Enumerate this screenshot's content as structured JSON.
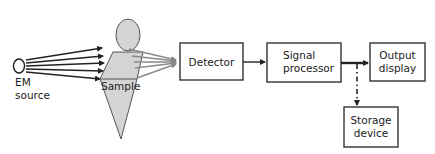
{
  "diagram": {
    "title": "",
    "nodes": {
      "em_source": {
        "line1": "EM",
        "line2": "source"
      },
      "sample": {
        "label": "Sample"
      },
      "detector": {
        "label": "Detector"
      },
      "signal_processor": {
        "line1": "Signal",
        "line2": "processor"
      },
      "output_display": {
        "line1": "Output",
        "line2": "display"
      },
      "storage_device": {
        "line1": "Storage",
        "line2": "device"
      }
    },
    "edges": [
      {
        "from": "EM source",
        "to": "Sample",
        "style": "multiple dark arrows"
      },
      {
        "from": "Sample",
        "to": "Detector",
        "style": "multiple gray converging rays"
      },
      {
        "from": "Detector",
        "to": "Signal processor",
        "style": "solid arrow"
      },
      {
        "from": "Signal processor",
        "to": "Output display",
        "style": "solid thick arrow"
      },
      {
        "from": "Signal processor",
        "to": "Storage device",
        "style": "dash-dot arrow"
      }
    ],
    "colors": {
      "sample_fill": "#d4d4d4",
      "outline": "#333333",
      "rays_gray": "#8a8a8a"
    }
  }
}
